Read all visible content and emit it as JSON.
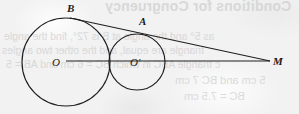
{
  "figure": {
    "kind": "geometry-diagram",
    "stroke_color": "#1f1f1f",
    "background_color": "#f2f2f2",
    "label_color": "#1b1b1b"
  },
  "labels": {
    "B": "B",
    "A": "A",
    "M": "M",
    "O": "O",
    "O_prime": "O'"
  },
  "bleed_through_text": {
    "heading": "Conditions for Congruency",
    "line_1": "as 5° and the angle at B is 72°, find the angle",
    "line_2": "triangle are equal, and the other two angles",
    "line_3": "c triangle ABC in which BC = 6 cm and AB = 5",
    "line_4": "5 cm and BC 7 cm",
    "line_5": "BC = 7.5 cm"
  },
  "geometry": {
    "circle_large": {
      "cx": 66,
      "cy": 62,
      "r": 44
    },
    "circle_small": {
      "cx": 137,
      "cy": 62,
      "r": 28
    },
    "tangency_point": {
      "x": 110,
      "y": 62
    },
    "line_of_centers": {
      "x1": 66,
      "y1": 61,
      "x2": 270,
      "y2": 61
    },
    "tangent_line": {
      "x1": 70,
      "y1": 18,
      "x2": 270,
      "y2": 61
    },
    "point_B": {
      "x": 70,
      "y": 18
    },
    "point_A": {
      "x": 141,
      "y": 31
    },
    "point_M": {
      "x": 270,
      "y": 61
    }
  }
}
